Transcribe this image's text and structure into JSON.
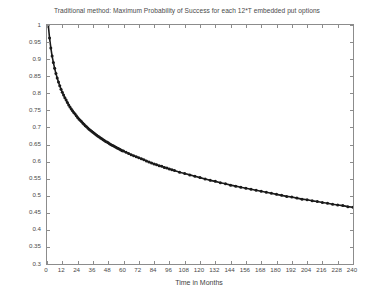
{
  "chart_data": {
    "type": "line",
    "title": "Traditional method: Maximum Probability of Success for each 12*T embedded put options",
    "xlabel": "Time in Months",
    "ylabel": "Maximum Probability of Success",
    "xlim": [
      0,
      240
    ],
    "ylim": [
      0.3,
      1
    ],
    "grid": false,
    "legend": null,
    "marker": "filled-circle",
    "line_color": "#1a1a1a",
    "xticks": [
      0,
      12,
      24,
      36,
      48,
      60,
      72,
      84,
      96,
      108,
      120,
      132,
      144,
      156,
      168,
      180,
      192,
      204,
      216,
      228,
      240
    ],
    "yticks": [
      0.3,
      0.35,
      0.4,
      0.45,
      0.5,
      0.55,
      0.6,
      0.65,
      0.7,
      0.75,
      0.8,
      0.85,
      0.9,
      0.95,
      1
    ],
    "x": [
      1,
      2,
      3,
      4,
      5,
      6,
      7,
      8,
      9,
      10,
      11,
      12,
      13,
      14,
      15,
      16,
      17,
      18,
      19,
      20,
      21,
      22,
      23,
      24,
      25,
      26,
      27,
      28,
      29,
      30,
      31,
      32,
      33,
      34,
      35,
      36,
      37,
      38,
      39,
      40,
      41,
      42,
      43,
      44,
      45,
      46,
      47,
      48,
      49,
      50,
      51,
      52,
      53,
      54,
      55,
      56,
      57,
      58,
      59,
      60,
      62,
      64,
      66,
      68,
      70,
      72,
      74,
      76,
      78,
      80,
      82,
      84,
      86,
      88,
      90,
      92,
      94,
      96,
      98,
      100,
      104,
      108,
      112,
      116,
      120,
      124,
      128,
      132,
      136,
      140,
      144,
      148,
      152,
      156,
      160,
      164,
      168,
      172,
      176,
      180,
      184,
      188,
      192,
      196,
      200,
      204,
      208,
      212,
      216,
      220,
      224,
      228,
      232,
      236,
      240
    ],
    "y": [
      1.0,
      0.962,
      0.933,
      0.909,
      0.89,
      0.873,
      0.858,
      0.845,
      0.833,
      0.822,
      0.812,
      0.803,
      0.795,
      0.787,
      0.78,
      0.773,
      0.766,
      0.76,
      0.754,
      0.749,
      0.744,
      0.739,
      0.734,
      0.729,
      0.725,
      0.721,
      0.717,
      0.713,
      0.709,
      0.705,
      0.702,
      0.698,
      0.695,
      0.692,
      0.689,
      0.686,
      0.683,
      0.68,
      0.677,
      0.674,
      0.672,
      0.669,
      0.667,
      0.664,
      0.662,
      0.659,
      0.657,
      0.655,
      0.652,
      0.65,
      0.648,
      0.646,
      0.644,
      0.642,
      0.64,
      0.638,
      0.636,
      0.634,
      0.632,
      0.631,
      0.627,
      0.624,
      0.62,
      0.617,
      0.614,
      0.611,
      0.608,
      0.605,
      0.602,
      0.599,
      0.596,
      0.593,
      0.591,
      0.588,
      0.586,
      0.583,
      0.581,
      0.578,
      0.576,
      0.574,
      0.569,
      0.565,
      0.561,
      0.557,
      0.553,
      0.549,
      0.545,
      0.542,
      0.538,
      0.535,
      0.531,
      0.528,
      0.525,
      0.522,
      0.519,
      0.516,
      0.513,
      0.51,
      0.507,
      0.504,
      0.501,
      0.498,
      0.496,
      0.493,
      0.49,
      0.488,
      0.485,
      0.483,
      0.48,
      0.478,
      0.475,
      0.473,
      0.471,
      0.468,
      0.466
    ]
  },
  "axis": {
    "xtick_labels": [
      "0",
      "12",
      "24",
      "36",
      "48",
      "60",
      "72",
      "84",
      "96",
      "108",
      "120",
      "132",
      "144",
      "156",
      "168",
      "180",
      "192",
      "204",
      "216",
      "228",
      "240"
    ],
    "ytick_labels": [
      "0.3",
      "0.35",
      "0.4",
      "0.45",
      "0.5",
      "0.55",
      "0.6",
      "0.65",
      "0.7",
      "0.75",
      "0.8",
      "0.85",
      "0.9",
      "0.95",
      "1"
    ]
  }
}
